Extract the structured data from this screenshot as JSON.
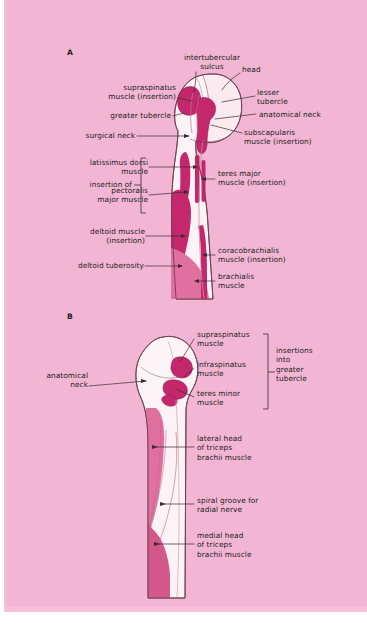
{
  "figure": {
    "background_color": "#f2b5d4",
    "page_color": "#ffffff",
    "bone_fill": "#fdf2f6",
    "bone_outline": "#6d4050",
    "muscle_dark": "#c4276b",
    "muscle_mid": "#e0709f",
    "muscle_light": "#f0a9c6",
    "label_color": "#231f20",
    "leader_color": "#3b2b31"
  },
  "panels": [
    {
      "id": "A",
      "letter": "A"
    },
    {
      "id": "B",
      "letter": "B"
    }
  ],
  "panel_a": {
    "letter": "A",
    "labels": {
      "intertubercular_sulcus": "intertubercular\nsulcus",
      "head": "head",
      "lesser_tubercle": "lesser\ntubercle",
      "anatomical_neck": "anatomical neck",
      "subscapularis": "subscapularis\nmuscle (insertion)",
      "supraspinatus": "supraspinatus\nmuscle (insertion)",
      "greater_tubercle": "greater tubercle",
      "surgical_neck": "surgical neck",
      "insertion_of": "insertion of",
      "latissimus_dorsi": "latissimus dorsi\nmuscle",
      "pectoralis_major": "pectoralis\nmajor muscle",
      "teres_major": "teres major\nmuscle (insertion)",
      "deltoid_muscle": "deltoid muscle\n(insertion)",
      "deltoid_tuberosity": "deltoid tuberosity",
      "coracobrachialis": "coracobrachialis\nmuscle (insertion)",
      "brachialis": "brachialis\nmuscle"
    }
  },
  "panel_b": {
    "letter": "B",
    "labels": {
      "supraspinatus": "supraspinatus\nmuscle",
      "infraspinatus": "infraspinatus\nmuscle",
      "teres_minor": "teres minor\nmuscle",
      "insertions_group": "insertions\ninto\ngreater\ntubercle",
      "anatomical_neck": "anatomical\nneck",
      "lateral_head_triceps": "lateral head\nof triceps\nbrachii muscle",
      "spiral_groove": "spiral groove for\nradial nerve",
      "medial_head_triceps": "medial head\nof triceps\nbrachii muscle"
    }
  }
}
